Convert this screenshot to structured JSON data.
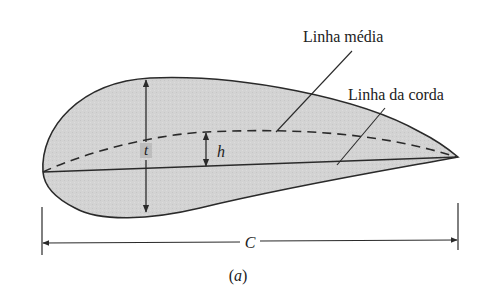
{
  "figure": {
    "type": "airfoil-geometry-diagram",
    "caption": "(a)",
    "labels": {
      "mean_line": "Linha média",
      "chord_line": "Linha da corda",
      "thickness": "t",
      "camber": "h",
      "chord_length": "C"
    },
    "colors": {
      "fill": "#d4d4d4",
      "stroke": "#2a2a2a",
      "background": "#ffffff"
    }
  }
}
